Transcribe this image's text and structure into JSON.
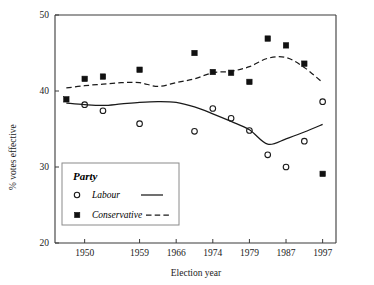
{
  "chart_data": {
    "type": "scatter",
    "title": "",
    "xlabel": "Election year",
    "ylabel": "% votes effective",
    "ylim": [
      20,
      50
    ],
    "yticks": [
      20,
      30,
      40,
      50
    ],
    "xticklabels": [
      "1950",
      "1959",
      "1966",
      "1974",
      "1979",
      "1987",
      "1997"
    ],
    "xtick_indices": [
      1,
      4,
      6,
      8,
      10,
      12,
      14
    ],
    "grid": false,
    "legend_position": "lower-left inside axes",
    "x_categories": [
      "1945",
      "1950",
      "1951",
      "1955",
      "1959",
      "1964",
      "1966",
      "1970",
      "1974F",
      "1974O",
      "1979",
      "1983",
      "1987",
      "1992",
      "1997"
    ],
    "series": [
      {
        "name": "Labour",
        "marker": "open-circle",
        "line": "solid",
        "values": [
          null,
          38.2,
          37.4,
          null,
          35.7,
          null,
          null,
          34.7,
          37.7,
          36.4,
          34.8,
          31.6,
          30.0,
          33.4,
          38.6
        ],
        "trend": [
          38.4,
          38.2,
          38.1,
          38.3,
          38.5,
          38.6,
          38.5,
          37.9,
          37.0,
          36.0,
          34.9,
          33.0,
          33.7,
          34.6,
          35.6
        ]
      },
      {
        "name": "Conservative",
        "marker": "filled-square",
        "line": "dashed",
        "values": [
          38.9,
          41.6,
          41.9,
          null,
          42.8,
          null,
          null,
          45.0,
          42.5,
          42.4,
          41.2,
          46.9,
          46.0,
          43.6,
          29.1
        ],
        "trend": [
          40.4,
          40.7,
          40.9,
          41.1,
          41.1,
          40.6,
          41.1,
          41.6,
          42.4,
          42.6,
          43.2,
          44.3,
          44.4,
          43.1,
          41.1
        ]
      }
    ]
  },
  "legend": {
    "title": "Party",
    "entries": [
      {
        "label": "Labour",
        "marker": "open-circle",
        "line": "solid"
      },
      {
        "label": "Conservative",
        "marker": "filled-square",
        "line": "dashed"
      }
    ]
  },
  "axes": {
    "y_title": "% votes effective",
    "x_title": "Election year",
    "y_tick_labels": [
      "20",
      "30",
      "40",
      "50"
    ],
    "x_tick_labels": [
      "1950",
      "1959",
      "1966",
      "1974",
      "1979",
      "1987",
      "1997"
    ]
  }
}
